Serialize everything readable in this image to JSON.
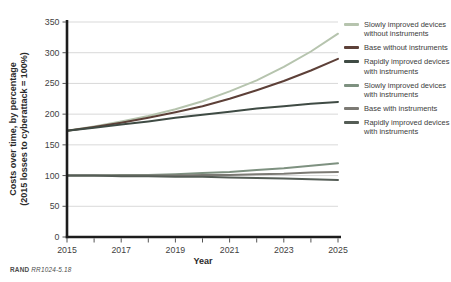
{
  "chart_data": {
    "type": "line",
    "x": [
      2015,
      2016,
      2017,
      2018,
      2019,
      2020,
      2021,
      2022,
      2023,
      2024,
      2025
    ],
    "xlim": [
      2015,
      2025
    ],
    "ylim": [
      0,
      350
    ],
    "ytick_step": 50,
    "yticks": [
      0,
      50,
      100,
      150,
      200,
      250,
      300,
      350
    ],
    "xticks_minor_every_year": true,
    "xticks_labeled": [
      2015,
      2017,
      2019,
      2021,
      2023,
      2025
    ],
    "grid": "horizontal",
    "legend_position": "right",
    "xlabel": "Year",
    "ylabel_lines": [
      "Costs over time, by percentage",
      "(2015 losses to cyberattack = 100%)"
    ],
    "series": [
      {
        "name": "Slowly improved devices without instruments",
        "color": "#b6c4ae",
        "values": [
          173,
          180,
          188,
          197,
          208,
          221,
          237,
          255,
          277,
          302,
          331
        ]
      },
      {
        "name": "Base without instruments",
        "color": "#5d4038",
        "values": [
          173,
          179,
          186,
          194,
          203,
          213,
          225,
          239,
          254,
          271,
          290
        ]
      },
      {
        "name": "Rapidly improved devices with instruments",
        "color": "#3f4b44",
        "values": [
          173,
          178,
          183,
          188,
          194,
          199,
          204,
          209,
          213,
          217,
          220
        ]
      },
      {
        "name": "Slowly improved devices with instruments",
        "color": "#7e9180",
        "values": [
          100,
          100,
          101,
          101,
          102,
          104,
          106,
          109,
          112,
          116,
          120
        ]
      },
      {
        "name": "Base with instruments",
        "color": "#7c7a74",
        "values": [
          100,
          100,
          100,
          100,
          100,
          101,
          101,
          102,
          103,
          105,
          106
        ]
      },
      {
        "name": "Rapidly improved devices with instruments",
        "color": "#555d56",
        "values": [
          100,
          100,
          99,
          99,
          98,
          98,
          97,
          96,
          95,
          94,
          93
        ]
      }
    ]
  },
  "caption": {
    "brand": "RAND",
    "id": "RR1024-5.18"
  },
  "colors": {
    "grid": "#d9d9d9",
    "axis": "#1c1c1c",
    "tick": "#555555",
    "background": "#ffffff"
  }
}
